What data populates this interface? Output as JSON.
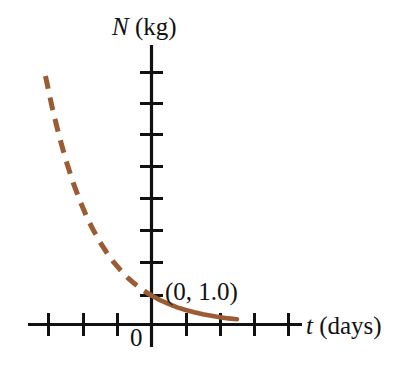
{
  "figure": {
    "background_color": "#ffffff",
    "width": 402,
    "height": 380
  },
  "labels": {
    "y_axis_symbol": "N",
    "y_axis_unit": " (kg)",
    "x_axis_symbol": "t",
    "x_axis_unit": " (days)",
    "origin": "0",
    "point_annotation": "(0, 1.0)"
  },
  "chart_data": {
    "type": "line",
    "title": "",
    "xlabel": "t (days)",
    "ylabel": "N (kg)",
    "grid": false,
    "legend": null,
    "axis_style": "centered-cross-axes-with-tick-marks-unlabeled",
    "xlim": [
      -3.1,
      4.2
    ],
    "ylim": [
      -0.35,
      9.2
    ],
    "x_ticks": [
      -3,
      -2,
      -1,
      1,
      2,
      3,
      4
    ],
    "y_ticks": [
      1,
      2,
      3,
      4,
      5,
      6,
      7,
      8
    ],
    "x_tick_labels": [],
    "y_tick_labels": [],
    "annotations": [
      {
        "text": "(0, 1.0)",
        "x": 0,
        "y": 1.0,
        "description": "intercept of decay curve with N axis"
      },
      {
        "text": "0",
        "x": 0,
        "y": 0,
        "description": "origin marker"
      }
    ],
    "series": [
      {
        "name": "N(t) extrapolated (t < 0)",
        "color": "#9b5c33",
        "linestyle": "dashed",
        "linewidth": 5,
        "function": "N = 1.0 * 2^(-t)",
        "x": [
          -3.1,
          -2.9,
          -2.7,
          -2.5,
          -2.3,
          -2.1,
          -1.9,
          -1.7,
          -1.5,
          -1.3,
          -1.1,
          -0.9,
          -0.7,
          -0.5,
          -0.3,
          -0.1,
          0.0
        ],
        "y": [
          8.57,
          7.46,
          6.5,
          5.66,
          4.92,
          4.29,
          3.73,
          3.25,
          2.83,
          2.46,
          2.14,
          1.87,
          1.62,
          1.41,
          1.23,
          1.07,
          1.0
        ]
      },
      {
        "name": "N(t) measured (t >= 0)",
        "color": "#9b5c33",
        "linestyle": "solid",
        "linewidth": 4.6,
        "function": "N = 1.0 * 2^(-t)",
        "x": [
          0.0,
          0.25,
          0.5,
          0.75,
          1.0,
          1.25,
          1.5,
          1.75,
          2.0,
          2.25,
          2.5
        ],
        "y": [
          1.0,
          0.84,
          0.71,
          0.59,
          0.5,
          0.42,
          0.35,
          0.3,
          0.25,
          0.21,
          0.18
        ]
      }
    ],
    "colors": {
      "curve": "#9b5c33",
      "axis": "#111111",
      "text": "#111111",
      "background": "#ffffff"
    }
  }
}
